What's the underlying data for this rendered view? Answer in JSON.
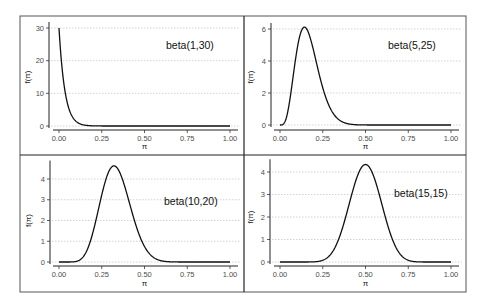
{
  "chart_data": [
    {
      "type": "line",
      "title": "beta(1,30)",
      "label": "beta(1,30)",
      "alpha": 1,
      "beta": 30,
      "xlabel": "π",
      "ylabel": "f(π)",
      "xlim": [
        0,
        1
      ],
      "ylim": [
        0,
        30
      ],
      "xticks": [
        "0.00",
        "0.25",
        "0.50",
        "0.75",
        "1.00"
      ],
      "yticks": [
        "0",
        "10",
        "20",
        "30"
      ],
      "grid": "horizontal dotted",
      "x": [
        0.0,
        0.05,
        0.1,
        0.15,
        0.2,
        0.25,
        0.5,
        0.75,
        1.0
      ],
      "values": [
        30.0,
        6.78,
        1.41,
        0.27,
        0.05,
        0.01,
        0.0,
        0.0,
        0.0
      ]
    },
    {
      "type": "line",
      "title": "beta(5,25)",
      "label": "beta(5,25)",
      "alpha": 5,
      "beta": 25,
      "xlabel": "π",
      "ylabel": "f(π)",
      "xlim": [
        0,
        1
      ],
      "ylim": [
        0,
        6
      ],
      "xticks": [
        "0.00",
        "0.25",
        "0.50",
        "0.75",
        "1.00"
      ],
      "yticks": [
        "0",
        "2",
        "4",
        "6"
      ],
      "grid": "horizontal dotted",
      "x": [
        0.0,
        0.05,
        0.1,
        0.143,
        0.2,
        0.25,
        0.3,
        0.4,
        0.5,
        0.75,
        1.0
      ],
      "values": [
        0.0,
        1.34,
        4.85,
        6.1,
        4.89,
        2.76,
        1.23,
        0.14,
        0.01,
        0.0,
        0.0
      ]
    },
    {
      "type": "line",
      "title": "beta(10,20)",
      "label": "beta(10,20)",
      "alpha": 10,
      "beta": 20,
      "xlabel": "π",
      "ylabel": "f(π)",
      "xlim": [
        0,
        1
      ],
      "ylim": [
        0,
        4.6
      ],
      "xticks": [
        "0.00",
        "0.25",
        "0.50",
        "0.75",
        "1.00"
      ],
      "yticks": [
        "0",
        "1",
        "2",
        "3",
        "4"
      ],
      "grid": "horizontal dotted",
      "x": [
        0.0,
        0.1,
        0.2,
        0.25,
        0.321,
        0.4,
        0.5,
        0.6,
        0.75,
        1.0
      ],
      "values": [
        0.0,
        0.05,
        2.02,
        3.54,
        4.63,
        3.45,
        0.94,
        0.1,
        0.0,
        0.0
      ]
    },
    {
      "type": "line",
      "title": "beta(15,15)",
      "label": "beta(15,15)",
      "alpha": 15,
      "beta": 15,
      "xlabel": "π",
      "ylabel": "f(π)",
      "xlim": [
        0,
        1
      ],
      "ylim": [
        0,
        4.3
      ],
      "xticks": [
        "0.00",
        "0.25",
        "0.50",
        "0.75",
        "1.00"
      ],
      "yticks": [
        "0",
        "1",
        "2",
        "3",
        "4"
      ],
      "grid": "horizontal dotted",
      "x": [
        0.0,
        0.2,
        0.25,
        0.3,
        0.4,
        0.5,
        0.6,
        0.7,
        0.75,
        0.8,
        1.0
      ],
      "values": [
        0.0,
        0.01,
        0.08,
        0.42,
        2.69,
        4.3,
        2.69,
        0.42,
        0.08,
        0.01,
        0.0
      ]
    }
  ],
  "panels": [
    {
      "label": "beta(1,30)"
    },
    {
      "label": "beta(5,25)"
    },
    {
      "label": "beta(10,20)"
    },
    {
      "label": "beta(15,15)"
    }
  ]
}
